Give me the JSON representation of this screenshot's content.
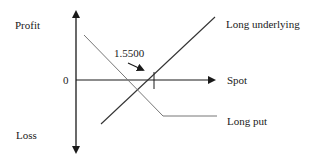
{
  "diagram": {
    "labels": {
      "profit": "Profit",
      "loss": "Loss",
      "zero": "0",
      "spot": "Spot",
      "strike": "1.5500",
      "long_underlying": "Long underlying",
      "long_put": "Long put"
    },
    "colors": {
      "axis": "#1a1a1a",
      "long_underlying_line": "#333333",
      "long_put_line": "#777777",
      "text": "#1a1a1a"
    }
  }
}
